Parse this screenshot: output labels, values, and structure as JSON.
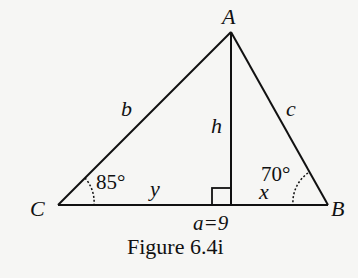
{
  "diagram": {
    "vertices": {
      "A": "A",
      "B": "B",
      "C": "C"
    },
    "sides": {
      "b": "b",
      "c": "c",
      "h": "h",
      "a": "a=9"
    },
    "segments": {
      "y": "y",
      "x": "x"
    },
    "angles": {
      "C": "85°",
      "B": "70°"
    },
    "caption": "Figure 6.4i"
  }
}
